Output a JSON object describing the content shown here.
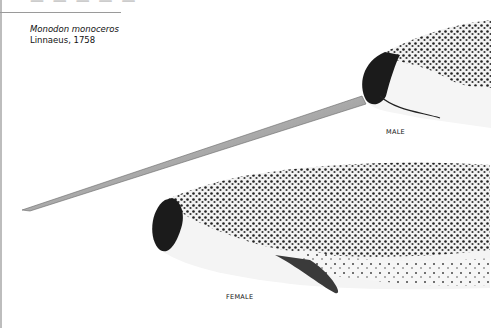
{
  "heading_partial": "— — — — —",
  "species": {
    "scientific_name": "Monodon monoceros",
    "authority": "Linnaeus, 1758"
  },
  "labels": {
    "male": "MALE",
    "female": "FEMALE"
  },
  "colors": {
    "ink": "#111111",
    "body_light": "#f4f4f4",
    "rule": "#9a9a9a"
  }
}
